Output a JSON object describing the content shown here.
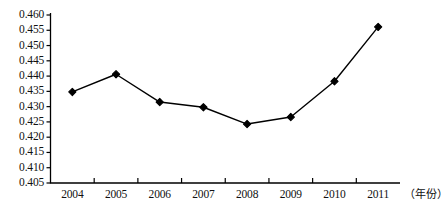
{
  "chart_data": {
    "type": "line",
    "title": "",
    "subtitle": "",
    "xlabel": "（年份）",
    "ylabel": "",
    "categories": [
      "2004",
      "2005",
      "2006",
      "2007",
      "2008",
      "2009",
      "2010",
      "2011"
    ],
    "values": [
      0.4348,
      0.4406,
      0.4315,
      0.4298,
      0.4243,
      0.4266,
      0.4383,
      0.4561
    ],
    "series": [
      {
        "name": "",
        "values": [
          0.4348,
          0.4406,
          0.4315,
          0.4298,
          0.4243,
          0.4266,
          0.4383,
          0.4561
        ]
      }
    ],
    "ylim": [
      0.405,
      0.46
    ],
    "ytick_step": 0.005,
    "ytick_labels": [
      "0.460",
      "0.455",
      "0.450",
      "0.445",
      "0.440",
      "0.435",
      "0.430",
      "0.425",
      "0.420",
      "0.415",
      "0.410",
      "0.405"
    ],
    "xtick_labels": [
      "2004",
      "2005",
      "2006",
      "2007",
      "2008",
      "2009",
      "2010",
      "2011"
    ],
    "grid": false,
    "legend": "none",
    "marker": "diamond",
    "line_color": "#000000",
    "marker_color": "#000000",
    "axis_color": "#000000",
    "background": "#ffffff"
  }
}
